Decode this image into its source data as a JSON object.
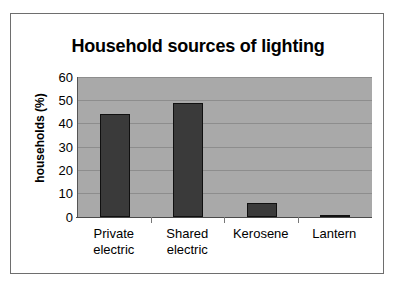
{
  "chart_data": {
    "type": "bar",
    "title": "Household sources of lighting",
    "xlabel": "",
    "ylabel": "households (%)",
    "categories": [
      "Private electric",
      "Shared electric",
      "Kerosene",
      "Lantern"
    ],
    "category_lines": [
      [
        "Private",
        "electric"
      ],
      [
        "Shared",
        "electric"
      ],
      [
        "Kerosene",
        ""
      ],
      [
        "Lantern",
        ""
      ]
    ],
    "values": [
      44,
      49,
      6,
      0.6
    ],
    "ylim": [
      0,
      60
    ],
    "yticks": [
      0,
      10,
      20,
      30,
      40,
      50,
      60
    ],
    "ytick_labels": [
      "0",
      "10",
      "20",
      "30",
      "40",
      "50",
      "60"
    ],
    "grid": true,
    "legend": false,
    "legend_position": "none",
    "colors": {
      "bar_fill": "#3a3a3a",
      "bar_edge": "#101010",
      "plot_background": "#a9a9a9",
      "gridline": "#8d8d8d",
      "frame_border": "#6e6e6e",
      "text": "#000000",
      "page_background": "#ffffff"
    }
  }
}
